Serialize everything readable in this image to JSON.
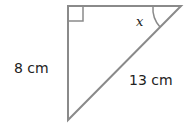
{
  "diagram": {
    "type": "right-triangle",
    "vertical_side_label": "8 cm",
    "hypotenuse_label": "13 cm",
    "angle_label": "x",
    "right_angle_marker": true,
    "stroke_color": "#8a8a8a"
  }
}
